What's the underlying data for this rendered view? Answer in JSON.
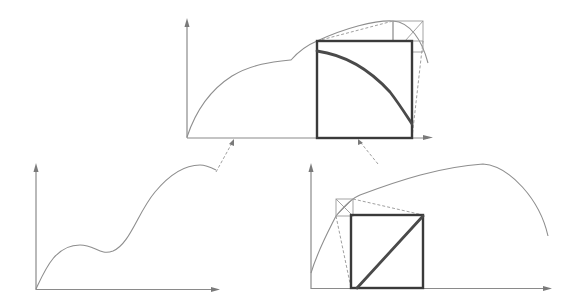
{
  "diagram": {
    "colors": {
      "axis": "#8a8a8a",
      "curve": "#8e8e8e",
      "box": "#3a3a3a",
      "highlight": "#4a4a4a",
      "background": "#ffffff"
    },
    "panels": [
      {
        "id": "top",
        "axes": {
          "origin": [
            187,
            137
          ],
          "x_end": 432,
          "y_end": 20
        },
        "curve": "M187,137 C196,110 210,90 232,76 C252,64 272,62 291,60 C298,52 305,46 317,41 C345,28 375,20 393,21 C410,22 422,40 428,63",
        "big_box": {
          "x": 317,
          "y": 41,
          "w": 95,
          "h": 97
        },
        "inner_curve": "M317,51 C345,55 370,70 390,92 C400,105 408,118 412,124",
        "small_box": {
          "x": 393,
          "y": 21,
          "w": 30,
          "h": 20
        }
      },
      {
        "id": "bottom-left",
        "axes": {
          "origin": [
            36,
            289
          ],
          "x_end": 218,
          "y_end": 163
        },
        "curve": "M36,289 C45,270 55,245 80,245 C95,245 100,256 113,251 C130,244 138,212 155,192 C170,174 185,165 200,165 C206,165 212,168 216,170"
      },
      {
        "id": "bottom-right",
        "axes": {
          "origin": [
            311,
            288
          ],
          "x_end": 551,
          "y_end": 163
        },
        "curve": "M311,273 C318,250 328,232 336,216 C345,205 352,198 360,195 C400,180 440,167 483,164 C510,166 540,200 548,236",
        "big_box": {
          "x": 351,
          "y": 215,
          "w": 72,
          "h": 73
        },
        "diagonal": [
          [
            357,
            288
          ],
          [
            423,
            215
          ]
        ],
        "small_box": {
          "x": 336,
          "y": 199,
          "w": 17,
          "h": 17
        }
      }
    ],
    "connectors": [
      {
        "from": [
          216,
          172
        ],
        "to": [
          233,
          141
        ]
      },
      {
        "from": [
          378,
          164
        ],
        "to": [
          360,
          141
        ]
      }
    ]
  }
}
